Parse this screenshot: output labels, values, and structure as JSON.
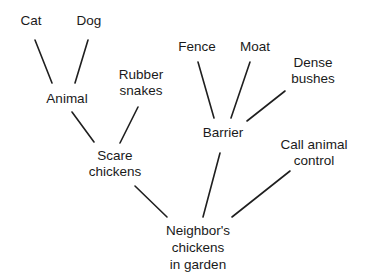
{
  "diagram": {
    "type": "tree",
    "nodes": [
      {
        "id": "cat",
        "lines": [
          "Cat"
        ]
      },
      {
        "id": "dog",
        "lines": [
          "Dog"
        ]
      },
      {
        "id": "animal",
        "lines": [
          "Animal"
        ]
      },
      {
        "id": "rubber_snakes",
        "lines": [
          "Rubber",
          "snakes"
        ]
      },
      {
        "id": "scare_chickens",
        "lines": [
          "Scare",
          "chickens"
        ]
      },
      {
        "id": "fence",
        "lines": [
          "Fence"
        ]
      },
      {
        "id": "moat",
        "lines": [
          "Moat"
        ]
      },
      {
        "id": "dense_bushes",
        "lines": [
          "Dense",
          "bushes"
        ]
      },
      {
        "id": "barrier",
        "lines": [
          "Barrier"
        ]
      },
      {
        "id": "call_animal_control",
        "lines": [
          "Call animal",
          "control"
        ]
      },
      {
        "id": "neighbors_chickens",
        "lines": [
          "Neighbor's",
          "chickens",
          "in garden"
        ]
      }
    ],
    "edges": [
      [
        "cat",
        "animal"
      ],
      [
        "dog",
        "animal"
      ],
      [
        "animal",
        "scare_chickens"
      ],
      [
        "rubber_snakes",
        "scare_chickens"
      ],
      [
        "fence",
        "barrier"
      ],
      [
        "moat",
        "barrier"
      ],
      [
        "dense_bushes",
        "barrier"
      ],
      [
        "scare_chickens",
        "neighbors_chickens"
      ],
      [
        "barrier",
        "neighbors_chickens"
      ],
      [
        "call_animal_control",
        "neighbors_chickens"
      ]
    ]
  }
}
